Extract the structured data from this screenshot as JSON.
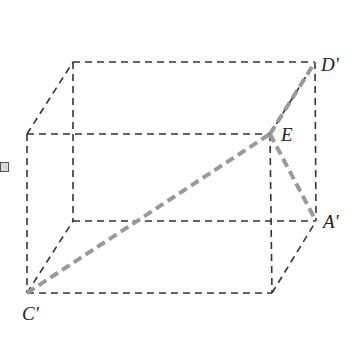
{
  "diagram": {
    "type": "rectangular-prism",
    "colors": {
      "edge": "#333333",
      "highlight": "#9a9a9a",
      "label": "#222222",
      "background": "#ffffff"
    },
    "vertices": {
      "back_top_left": [
        73,
        62
      ],
      "D_prime": [
        315,
        62
      ],
      "front_top_left": [
        27,
        134
      ],
      "E": [
        270,
        134
      ],
      "back_bottom_left": [
        73,
        221
      ],
      "A_prime": [
        316,
        221
      ],
      "C_prime": [
        27,
        293
      ],
      "front_bottom_right": [
        272,
        293
      ]
    },
    "labels": {
      "D_prime": "D'",
      "E": "E",
      "A_prime": "A'",
      "C_prime": "C'"
    },
    "highlighted_segments": [
      [
        "C_prime",
        "E"
      ],
      [
        "E",
        "D_prime"
      ],
      [
        "E",
        "A_prime"
      ]
    ]
  }
}
